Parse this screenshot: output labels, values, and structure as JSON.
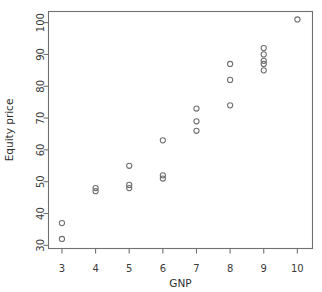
{
  "chart_data": {
    "type": "scatter",
    "title": "",
    "xlabel": "GNP",
    "ylabel": "Equity price",
    "xlim": [
      2.6,
      10.45
    ],
    "ylim": [
      29.0,
      103.5
    ],
    "xticks": [
      3,
      4,
      5,
      6,
      7,
      8,
      9,
      10
    ],
    "xtick_labels": [
      "3",
      "4",
      "5",
      "6",
      "7",
      "8",
      "9",
      "10"
    ],
    "yticks": [
      30,
      40,
      50,
      60,
      70,
      80,
      90,
      100
    ],
    "ytick_labels": [
      "30",
      "40",
      "50",
      "60",
      "70",
      "80",
      "90",
      "100"
    ],
    "grid": false,
    "legend": null,
    "marker": "open-circle",
    "marker_color": "#6e6e6e",
    "frame_color": "#717171",
    "background": "#ffffff",
    "x": [
      3,
      3,
      4,
      4,
      5,
      5,
      5,
      6,
      6,
      6,
      7,
      7,
      7,
      8,
      8,
      8,
      9,
      9,
      9,
      9,
      9,
      10
    ],
    "y": [
      37,
      32,
      48,
      47,
      55,
      49,
      48,
      63,
      52,
      51,
      73,
      69,
      66,
      87,
      82,
      74,
      92,
      90,
      88,
      87,
      85,
      101
    ],
    "points": [
      {
        "x": 3,
        "y": 37
      },
      {
        "x": 3,
        "y": 32
      },
      {
        "x": 4,
        "y": 48
      },
      {
        "x": 4,
        "y": 47
      },
      {
        "x": 5,
        "y": 55
      },
      {
        "x": 5,
        "y": 49
      },
      {
        "x": 5,
        "y": 48
      },
      {
        "x": 6,
        "y": 63
      },
      {
        "x": 6,
        "y": 52
      },
      {
        "x": 6,
        "y": 51
      },
      {
        "x": 7,
        "y": 73
      },
      {
        "x": 7,
        "y": 69
      },
      {
        "x": 7,
        "y": 66
      },
      {
        "x": 8,
        "y": 87
      },
      {
        "x": 8,
        "y": 82
      },
      {
        "x": 8,
        "y": 74
      },
      {
        "x": 9,
        "y": 92
      },
      {
        "x": 9,
        "y": 90
      },
      {
        "x": 9,
        "y": 88
      },
      {
        "x": 9,
        "y": 87
      },
      {
        "x": 9,
        "y": 85
      },
      {
        "x": 10,
        "y": 101
      }
    ]
  }
}
